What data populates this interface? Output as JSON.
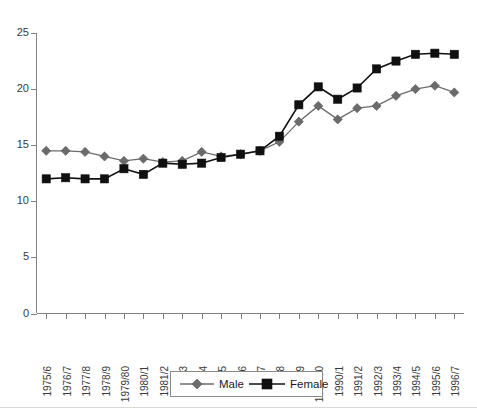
{
  "chart_data": {
    "type": "line",
    "title": "",
    "subtitle": "",
    "xlabel": "",
    "ylabel": "",
    "ylim": [
      0,
      25
    ],
    "yticks": [
      0,
      5,
      10,
      15,
      20,
      25
    ],
    "ytick_labels": [
      "0",
      "5",
      "10",
      "15",
      "20",
      "25"
    ],
    "grid": false,
    "legend_position": "bottom-center",
    "categories": [
      "1975/6",
      "1976/7",
      "1977/8",
      "1978/9",
      "1979/80",
      "1980/1",
      "1981/2",
      "1982/3",
      "1983/4",
      "1984/5",
      "1985/6",
      "1986/7",
      "1987/8",
      "1988/9",
      "1989/90",
      "1990/1",
      "1991/2",
      "1992/3",
      "1993/4",
      "1994/5",
      "1995/6",
      "1996/7"
    ],
    "series": [
      {
        "name": "Male",
        "color": "#6b6b6b",
        "marker": "diamond",
        "values": [
          14.5,
          14.5,
          14.4,
          14.0,
          13.6,
          13.8,
          13.5,
          13.6,
          14.4,
          14.0,
          14.2,
          14.5,
          15.3,
          17.1,
          18.5,
          17.3,
          18.3,
          18.5,
          19.4,
          20.0,
          20.3,
          19.7
        ]
      },
      {
        "name": "Female",
        "color": "#101010",
        "marker": "square",
        "values": [
          12.0,
          12.1,
          12.0,
          12.0,
          12.9,
          12.4,
          13.4,
          13.3,
          13.4,
          13.9,
          14.2,
          14.5,
          15.8,
          18.6,
          20.2,
          19.1,
          20.1,
          21.8,
          22.5,
          23.1,
          23.2,
          23.1
        ]
      }
    ]
  },
  "legend": {
    "items": [
      {
        "label": "Male"
      },
      {
        "label": "Female"
      }
    ]
  },
  "axes": {
    "y_axis_name": "value-axis",
    "x_axis_name": "category-axis"
  }
}
